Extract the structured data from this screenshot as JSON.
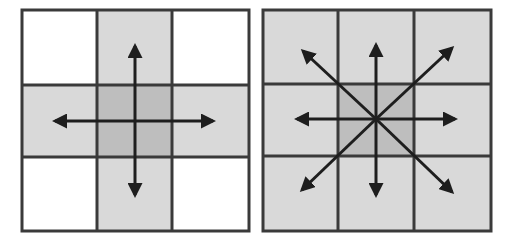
{
  "colors": {
    "background": "#ffffff",
    "grid_line": "#3a3a3a",
    "neighbor_fill": "#d8d8d8",
    "center_fill": "#bdbdbd",
    "empty_fill": "#ffffff",
    "arrow": "#1e1e1e"
  },
  "diagrams": [
    {
      "name": "4-neighborhood",
      "description": "3x3 grid with center cell and its 4 orthogonal neighbors shaded; arrows point up, down, left, right",
      "arrows": [
        "up",
        "down",
        "left",
        "right"
      ],
      "shaded_cells": [
        "N",
        "W",
        "C",
        "E",
        "S"
      ]
    },
    {
      "name": "8-neighborhood",
      "description": "3x3 grid with all cells shaded, center darker; arrows point in 8 directions",
      "arrows": [
        "up",
        "down",
        "left",
        "right",
        "up-left",
        "up-right",
        "down-left",
        "down-right"
      ],
      "shaded_cells": [
        "NW",
        "N",
        "NE",
        "W",
        "C",
        "E",
        "SW",
        "S",
        "SE"
      ]
    }
  ]
}
